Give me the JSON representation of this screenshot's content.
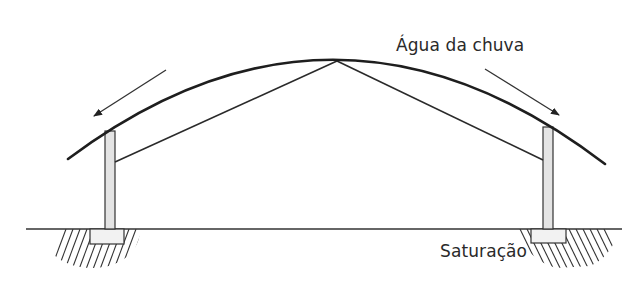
{
  "diagram": {
    "labels": {
      "rain_water": "Água da chuva",
      "saturation": "Saturação"
    },
    "colors": {
      "line": "#222222",
      "column_fill": "#e4e4e4",
      "footing_fill": "#f2f2f2",
      "hatch": "#333333",
      "background": "#ffffff"
    },
    "elements": [
      {
        "id": "arched-roof",
        "type": "curve"
      },
      {
        "id": "left-column",
        "type": "column"
      },
      {
        "id": "right-column",
        "type": "column"
      },
      {
        "id": "truss-left-rafter",
        "type": "line"
      },
      {
        "id": "truss-right-rafter",
        "type": "line"
      },
      {
        "id": "ground-line",
        "type": "line"
      },
      {
        "id": "left-footing",
        "type": "footing"
      },
      {
        "id": "right-footing",
        "type": "footing"
      },
      {
        "id": "left-soil-hatch",
        "type": "hatch"
      },
      {
        "id": "right-soil-hatch",
        "type": "hatch"
      },
      {
        "id": "left-runoff-arrow",
        "type": "arrow",
        "direction": "down-left"
      },
      {
        "id": "right-runoff-arrow",
        "type": "arrow",
        "direction": "down-right"
      }
    ]
  }
}
